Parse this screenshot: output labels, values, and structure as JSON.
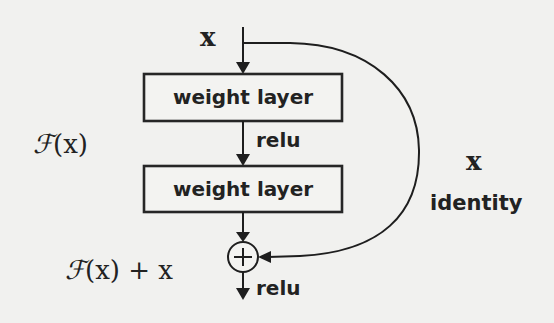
{
  "diagram": {
    "input_label": "x",
    "layers": [
      {
        "label": "weight layer"
      },
      {
        "label": "weight layer"
      }
    ],
    "activation_between": "relu",
    "activation_output": "relu",
    "residual_function_label": {
      "script": "ℱ",
      "rest": "(x)"
    },
    "sum_label": {
      "script": "ℱ",
      "rest": "(x) + x"
    },
    "sum_symbol": "+",
    "shortcut": {
      "variable_label": "x",
      "name_label": "identity"
    },
    "colors": {
      "background": "#f1f1ef",
      "stroke": "#1e1e1e",
      "text": "#222222"
    }
  }
}
